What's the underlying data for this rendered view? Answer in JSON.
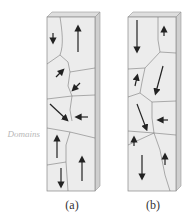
{
  "figure": {
    "side_label": "Domains",
    "captions": {
      "a": "(a)",
      "b": "(b)"
    },
    "colors": {
      "fill": "#e9e9e9",
      "side": "#cfcfcf",
      "top": "#dedede",
      "boundary": "#7a7a7a",
      "arrow": "#222222"
    }
  }
}
